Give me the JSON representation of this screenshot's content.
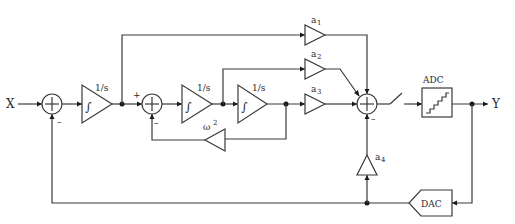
{
  "diagram": {
    "type": "block-diagram",
    "input_label": "X",
    "output_label": "Y",
    "summers": [
      {
        "id": "sum1",
        "signs": {
          "bottom": "–"
        }
      },
      {
        "id": "sum2",
        "signs": {
          "top": "+",
          "bottom": "–"
        }
      },
      {
        "id": "sum3",
        "signs": {
          "bottom": "–"
        }
      }
    ],
    "integrators": [
      {
        "id": "int1",
        "label": "1/s"
      },
      {
        "id": "int2",
        "label": "1/s"
      },
      {
        "id": "int3",
        "label": "1/s"
      }
    ],
    "gains": [
      {
        "id": "a1",
        "base": "a",
        "sub": "1"
      },
      {
        "id": "a2",
        "base": "a",
        "sub": "2"
      },
      {
        "id": "a3",
        "base": "a",
        "sub": "3"
      },
      {
        "id": "a4",
        "base": "a",
        "sub": "4"
      },
      {
        "id": "omega",
        "base": "ω",
        "sup": "2"
      }
    ],
    "adc_label": "ADC",
    "dac_label": "DAC",
    "integrator_glyph": "∫",
    "sum_glyph": "+",
    "minus": "–",
    "plus": "+"
  }
}
